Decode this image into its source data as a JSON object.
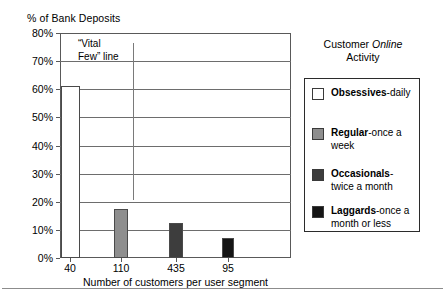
{
  "chart_data": {
    "type": "bar",
    "title": "",
    "ylabel": "% of Bank Deposits",
    "xlabel": "Number of customers per user segment",
    "categories": [
      "40",
      "110",
      "435",
      "95"
    ],
    "values": [
      61,
      17.5,
      12.5,
      7
    ],
    "ylim": [
      0,
      80
    ],
    "ytick_labels": [
      "0%",
      "10%",
      "20%",
      "30%",
      "40%",
      "50%",
      "60%",
      "70%",
      "80%"
    ],
    "ytick_values": [
      0,
      10,
      20,
      30,
      40,
      50,
      60,
      70,
      80
    ],
    "grid": true,
    "legend_position": "right",
    "bar_colors": [
      "#ffffff",
      "#8e8e8e",
      "#3d3d3d",
      "#151515"
    ],
    "series_names": [
      "Obsessives",
      "Regular",
      "Occasionals",
      "Laggards"
    ],
    "annotations": [
      {
        "name": "vital-few-line",
        "text_line1": "“Vital",
        "text_line2": "Few” line",
        "x_category_between": [
          "40",
          "110"
        ]
      }
    ]
  },
  "axes": {
    "y_title": "% of Bank Deposits",
    "x_title": "Number of customers per user segment",
    "y_ticks": [
      {
        "label": "80%",
        "value": 80
      },
      {
        "label": "70%",
        "value": 70
      },
      {
        "label": "60%",
        "value": 60
      },
      {
        "label": "50%",
        "value": 50
      },
      {
        "label": "40%",
        "value": 40
      },
      {
        "label": "30%",
        "value": 30
      },
      {
        "label": "20%",
        "value": 20
      },
      {
        "label": "10%",
        "value": 10
      },
      {
        "label": "0%",
        "value": 0
      }
    ],
    "x_ticks": [
      {
        "label": "40",
        "center": 70
      },
      {
        "label": "110",
        "center": 121
      },
      {
        "label": "435",
        "center": 176
      },
      {
        "label": "95",
        "center": 228
      }
    ]
  },
  "bars": [
    {
      "category": "40",
      "value": 61,
      "color": "#ffffff",
      "center": 70,
      "width": 19
    },
    {
      "category": "110",
      "value": 17.5,
      "color": "#8e8e8e",
      "center": 121,
      "width": 14
    },
    {
      "category": "435",
      "value": 12.5,
      "color": "#3d3d3d",
      "center": 176,
      "width": 14
    },
    {
      "category": "95",
      "value": 7,
      "color": "#151515",
      "center": 228,
      "width": 12
    }
  ],
  "annotation": {
    "line1": "“Vital",
    "line2": "Few” line"
  },
  "legend": {
    "title_line1_prefix": "Customer ",
    "title_line1_italic": "Online",
    "title_line2": "Activity",
    "items": [
      {
        "name": "Obsessives",
        "desc": "-daily",
        "color": "#ffffff"
      },
      {
        "name": "Regular",
        "desc": "-once a",
        "desc2": "week",
        "color": "#8e8e8e"
      },
      {
        "name": "Occasionals",
        "desc": "-",
        "desc2": "twice a month",
        "color": "#3d3d3d"
      },
      {
        "name": "Laggards",
        "desc": "-once a",
        "desc2": "month or less",
        "color": "#151515"
      }
    ]
  }
}
